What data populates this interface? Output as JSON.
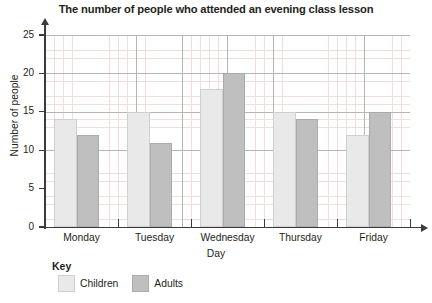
{
  "chart_data": {
    "type": "bar",
    "title": "The number of people who attended an evening class lesson",
    "xlabel": "Day",
    "ylabel": "Number of people",
    "categories": [
      "Monday",
      "Tuesday",
      "Wednesday",
      "Thursday",
      "Friday"
    ],
    "series": [
      {
        "name": "Children",
        "values": [
          14,
          15,
          18,
          15,
          12
        ],
        "color": "#e9e9e9"
      },
      {
        "name": "Adults",
        "values": [
          12,
          11,
          20,
          14,
          15
        ],
        "color": "#bfbfbf"
      }
    ],
    "ylim": [
      0,
      25
    ],
    "ytick_labels": [
      "25",
      "20",
      "15",
      "10",
      "5",
      "0"
    ],
    "ytick_values": [
      25,
      20,
      15,
      10,
      5,
      0
    ],
    "ytick_step": 5,
    "minor_grid_step": 1,
    "grid": true,
    "legend_position": "bottom-left"
  },
  "legend": {
    "title": "Key",
    "items": [
      {
        "label": "Children"
      },
      {
        "label": "Adults"
      }
    ]
  }
}
